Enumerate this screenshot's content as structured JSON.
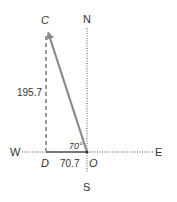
{
  "diagram": {
    "compass": {
      "north": "N",
      "south": "S",
      "east": "E",
      "west": "W"
    },
    "points": {
      "c": "C",
      "d": "D",
      "o": "O"
    },
    "measurements": {
      "vertical": "195.7",
      "horizontal": "70.7",
      "angle": "70°"
    },
    "colors": {
      "vector": "#8a8a8a",
      "axis": "#555555",
      "dashed": "#666666",
      "text": "#333333"
    }
  }
}
